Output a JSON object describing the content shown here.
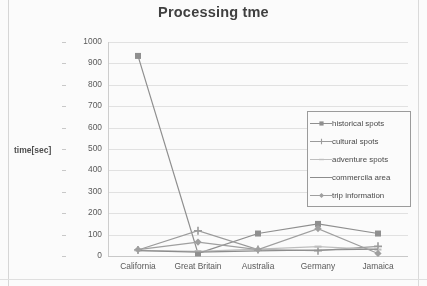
{
  "chart_data": {
    "type": "line",
    "title": "Processing tme",
    "xlabel": "",
    "ylabel": "time[sec]",
    "categories": [
      "California",
      "Great Britain",
      "Australia",
      "Germany",
      "Jamaica"
    ],
    "ylim": [
      0,
      1000
    ],
    "yticks": [
      0,
      100,
      200,
      300,
      400,
      500,
      600,
      700,
      800,
      900,
      1000
    ],
    "grid": true,
    "legend_position": "inside-upper-right",
    "series": [
      {
        "name": "historical spots",
        "marker": "square",
        "color": "#8d8d8d",
        "values": [
          935,
          12,
          105,
          150,
          105
        ]
      },
      {
        "name": "cultural spots",
        "marker": "plus",
        "color": "#9a9a9a",
        "values": [
          28,
          118,
          30,
          25,
          45
        ]
      },
      {
        "name": "adventure spots",
        "marker": "dash",
        "color": "#bfbfbf",
        "values": [
          26,
          22,
          32,
          44,
          30
        ]
      },
      {
        "name": "commercila area",
        "marker": "line",
        "color": "#8a8a8a",
        "values": [
          25,
          18,
          24,
          28,
          32
        ]
      },
      {
        "name": "trip information",
        "marker": "diamond",
        "color": "#9e9e9e",
        "values": [
          30,
          65,
          30,
          128,
          12
        ]
      }
    ]
  }
}
